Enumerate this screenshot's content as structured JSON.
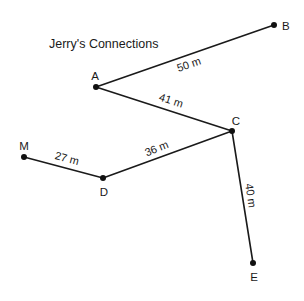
{
  "title": "Jerry's Connections",
  "colors": {
    "line": "#1a1a1a",
    "dot": "#111111",
    "background": "#ffffff"
  },
  "nodes": [
    {
      "id": "A",
      "label": "A"
    },
    {
      "id": "B",
      "label": "B"
    },
    {
      "id": "C",
      "label": "C"
    },
    {
      "id": "D",
      "label": "D"
    },
    {
      "id": "E",
      "label": "E"
    },
    {
      "id": "M",
      "label": "M"
    }
  ],
  "edges": [
    {
      "from": "A",
      "to": "B",
      "label": "50 m",
      "length_m": 50
    },
    {
      "from": "A",
      "to": "C",
      "label": "41 m",
      "length_m": 41
    },
    {
      "from": "C",
      "to": "E",
      "label": "40 m",
      "length_m": 40
    },
    {
      "from": "D",
      "to": "C",
      "label": "36 m",
      "length_m": 36
    },
    {
      "from": "M",
      "to": "D",
      "label": "27 m",
      "length_m": 27
    }
  ]
}
